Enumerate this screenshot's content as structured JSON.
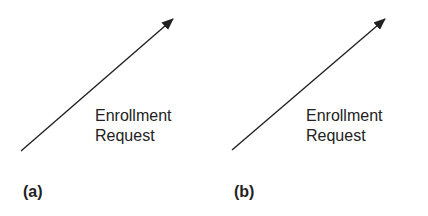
{
  "panels": [
    {
      "id": "a",
      "label": "(a)",
      "arrow": {
        "x1": 21,
        "y1": 151,
        "x2": 173,
        "y2": 19
      },
      "annotation": {
        "line1": "Enrollment",
        "line2": "Request"
      }
    },
    {
      "id": "b",
      "label": "(b)",
      "arrow": {
        "x1": 232,
        "y1": 150,
        "x2": 385,
        "y2": 19
      },
      "annotation": {
        "line1": "Enrollment",
        "line2": "Request"
      }
    }
  ],
  "colors": {
    "stroke": "#222222",
    "background": "#ffffff"
  }
}
